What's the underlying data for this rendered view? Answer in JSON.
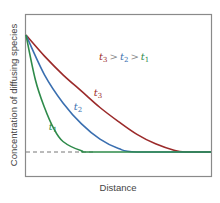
{
  "chart_data": {
    "type": "line",
    "title": "",
    "xlabel": "Distance",
    "ylabel": "Concentration of diffusing species",
    "annotation": "t3 > t2 > t1",
    "grid": false,
    "legend_position": "inside upper right",
    "series": [
      {
        "name": "t1",
        "color": "#2e8a4a",
        "description": "Steepest decay; reaches baseline at ~37% of distance",
        "points": [
          [
            0,
            1.0
          ],
          [
            0.05,
            0.62
          ],
          [
            0.1,
            0.38
          ],
          [
            0.15,
            0.2
          ],
          [
            0.2,
            0.09
          ],
          [
            0.3,
            0.01
          ],
          [
            0.37,
            0.0
          ],
          [
            1.0,
            0.0
          ]
        ]
      },
      {
        "name": "t2",
        "color": "#3a6fb0",
        "description": "Intermediate decay; reaches baseline at ~60% of distance",
        "points": [
          [
            0,
            1.0
          ],
          [
            0.1,
            0.66
          ],
          [
            0.2,
            0.42
          ],
          [
            0.3,
            0.24
          ],
          [
            0.4,
            0.11
          ],
          [
            0.5,
            0.03
          ],
          [
            0.6,
            0.0
          ],
          [
            1.0,
            0.0
          ]
        ]
      },
      {
        "name": "t3",
        "color": "#9b2a2a",
        "description": "Slowest decay; reaches baseline at ~86% of distance",
        "points": [
          [
            0,
            1.0
          ],
          [
            0.1,
            0.82
          ],
          [
            0.2,
            0.66
          ],
          [
            0.3,
            0.52
          ],
          [
            0.4,
            0.38
          ],
          [
            0.5,
            0.26
          ],
          [
            0.6,
            0.15
          ],
          [
            0.7,
            0.07
          ],
          [
            0.8,
            0.015
          ],
          [
            0.86,
            0.0
          ],
          [
            1.0,
            0.0
          ]
        ]
      }
    ],
    "baseline": {
      "style": "dashed",
      "value": 0,
      "color": "#777777"
    },
    "xlim": [
      0,
      1
    ],
    "ylim": [
      -0.21,
      1.17
    ]
  },
  "labels": {
    "xlabel": "Distance",
    "ylabel": "Concentration of diffusing species",
    "t1": {
      "base": "t",
      "sub": "1",
      "color": "#2e8a4a"
    },
    "t2": {
      "base": "t",
      "sub": "2",
      "color": "#3a6fb0"
    },
    "t3": {
      "base": "t",
      "sub": "3",
      "color": "#9b2a2a"
    },
    "legend": {
      "gt": ">"
    }
  }
}
